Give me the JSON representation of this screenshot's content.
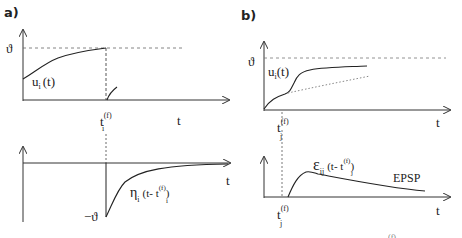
{
  "panels": {
    "a": {
      "label": "a)",
      "top": {
        "threshold_label": "ϑ",
        "curve_label_main": "u",
        "curve_label_sub": "i",
        "curve_label_arg": "(t)",
        "spike_time_main": "t",
        "spike_time_sub": "i",
        "spike_time_sup": "(f)",
        "xaxis_label": "t"
      },
      "bottom": {
        "min_label": "−ϑ",
        "curve_label_main": "η",
        "curve_label_sub": "i",
        "curve_label_arg": "(t- t",
        "curve_label_arg_sub": "i",
        "curve_label_arg_sup": "(f)",
        "curve_label_close": ")",
        "xaxis_label": "t"
      }
    },
    "b": {
      "label": "b)",
      "top": {
        "threshold_label": "ϑ",
        "curve_label_main": "u",
        "curve_label_sub": "i",
        "curve_label_arg": "(t)",
        "spike_time_main": "t",
        "spike_time_sub": "j",
        "spike_time_sup": "(f)",
        "xaxis_label": "t"
      },
      "bottom": {
        "curve_label_main": "ε",
        "curve_label_sub": "ij",
        "curve_label_arg": "(t- t",
        "curve_label_arg_sub": "j",
        "curve_label_arg_sup": "(f)",
        "curve_label_close": ")",
        "annotation": "EPSP",
        "spike_time_main": "t",
        "spike_time_sub": "j",
        "spike_time_sup": "(f)",
        "xaxis_label": "t"
      }
    }
  },
  "footer_fragment": "(f)",
  "colors": {
    "ink": "#222222",
    "dashed": "#555555",
    "dotted": "#777777"
  }
}
